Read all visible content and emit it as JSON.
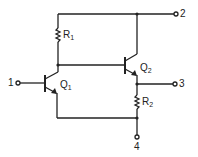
{
  "diagram": {
    "type": "circuit-schematic",
    "terminals": [
      {
        "id": "1",
        "label": "1"
      },
      {
        "id": "2",
        "label": "2"
      },
      {
        "id": "3",
        "label": "3"
      },
      {
        "id": "4",
        "label": "4"
      }
    ],
    "components": {
      "r1": {
        "label": "R",
        "sub": "1"
      },
      "r2": {
        "label": "R",
        "sub": "2"
      },
      "q1": {
        "label": "Q",
        "sub": "1"
      },
      "q2": {
        "label": "Q",
        "sub": "2"
      }
    },
    "colors": {
      "line": "#222222",
      "background": "#ffffff"
    }
  }
}
